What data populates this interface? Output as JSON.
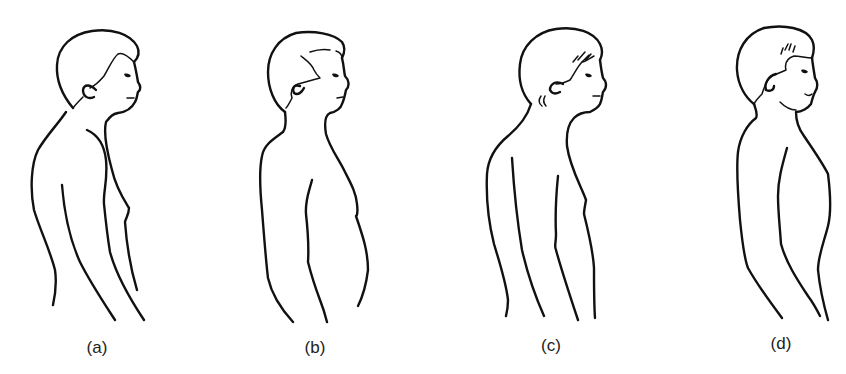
{
  "figure": {
    "line_color": "#111111",
    "background_color": "#ffffff",
    "panels": [
      {
        "id": "a",
        "label": "(a)"
      },
      {
        "id": "b",
        "label": "(b)"
      },
      {
        "id": "c",
        "label": "(c)"
      },
      {
        "id": "d",
        "label": "(d)"
      }
    ]
  }
}
